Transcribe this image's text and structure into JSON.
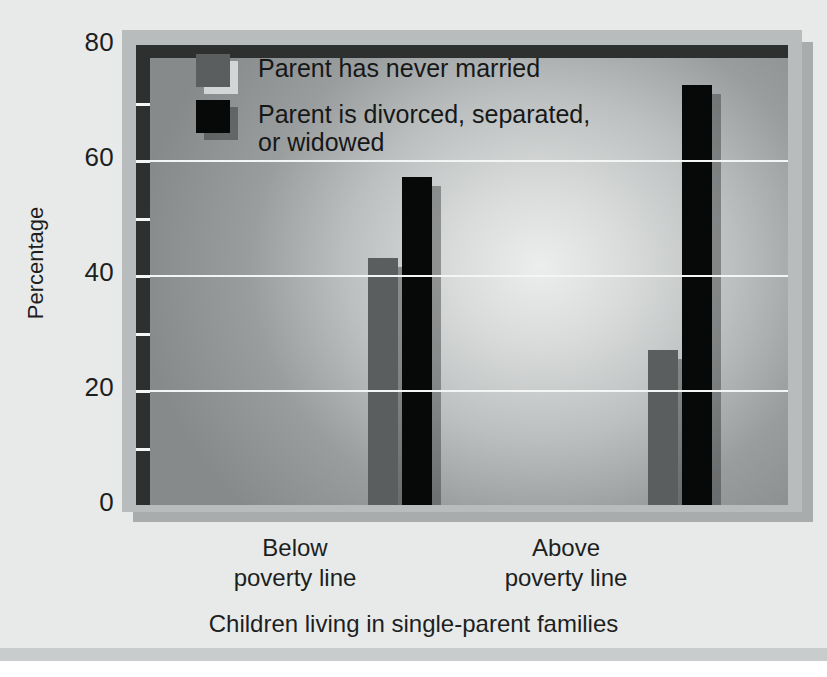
{
  "chart_data": {
    "type": "bar",
    "title": "",
    "subtitle": "",
    "xlabel": "Children living in single-parent families",
    "ylabel": "Percentage",
    "categories": [
      "Below\npoverty line",
      "Above\npoverty line"
    ],
    "series": [
      {
        "name": "Parent has never married",
        "values": [
          43,
          27
        ],
        "color": "#5b5e5e"
      },
      {
        "name": "Parent is divorced, separated,\nor widowed",
        "values": [
          57,
          73
        ],
        "color": "#070808"
      }
    ],
    "ylim": [
      0,
      80
    ],
    "yticks": [
      0,
      20,
      40,
      60,
      80
    ],
    "ytick_labels": [
      "0",
      "20",
      "40",
      "60",
      "80"
    ],
    "minor_yticks": [
      10,
      30,
      50,
      70
    ],
    "grid": true,
    "gridlines_at": [
      20,
      40,
      60
    ],
    "legend_position": "top-left-inside",
    "annotations": []
  },
  "legend": {
    "entries": [
      {
        "label": "Parent has never married",
        "swatch": "#5b5e5e"
      },
      {
        "label": "Parent is divorced, separated,\nor widowed",
        "swatch": "#070808"
      }
    ]
  },
  "axes": {
    "y_title": "Percentage",
    "x_title": "Children living in single-parent families",
    "y_labels": [
      "80",
      "60",
      "40",
      "20",
      "0"
    ],
    "x_labels": [
      "Below\npoverty line",
      "Above\npoverty line"
    ]
  },
  "colors": {
    "page_background": "#e8eaea",
    "frame": "#b9bcbc",
    "frame_shadow": "#a9acac",
    "plot_border": "#2e3030",
    "gridline": "#f4f6f6",
    "series_never_married": "#5b5e5e",
    "series_divorced": "#070808",
    "text": "#1d1f1f",
    "bottom_band": "#c9cccc"
  }
}
